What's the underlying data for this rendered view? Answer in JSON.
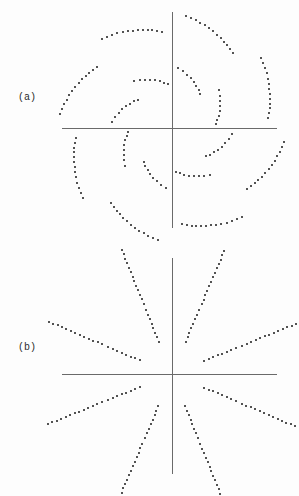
{
  "figure": {
    "width": 299,
    "height": 496,
    "background": "#fdfdfd",
    "dot_color": "#1a1a1a",
    "axis_color": "#6a6a6a",
    "label_color": "#2b2b2b",
    "dot_size_px": 2
  },
  "panels": [
    {
      "id": "a",
      "label": "(a)",
      "label_x": 18,
      "label_y": 98,
      "origin_x": 172,
      "origin_y": 128,
      "axes": {
        "h": {
          "x1": 62,
          "x2": 277,
          "y": 128
        },
        "v": {
          "y1": 12,
          "y2": 228,
          "x": 172
        }
      },
      "pattern_type": "spiral-arcs",
      "description": "Sixteen dotted spiral arcs arranged radially in two concentric rings around the crossed axes.",
      "rings": [
        {
          "radius": 52,
          "arc_span_deg": 34,
          "curl_deg": 30,
          "n_dots": 8,
          "n_arcs": 8,
          "phase_deg": 22
        },
        {
          "radius": 105,
          "arc_span_deg": 32,
          "curl_deg": 30,
          "n_dots": 13,
          "n_arcs": 8,
          "phase_deg": 22
        }
      ]
    },
    {
      "id": "b",
      "label": "(b)",
      "label_x": 18,
      "label_y": 348,
      "origin_x": 172,
      "origin_y": 374,
      "axes": {
        "h": {
          "x1": 62,
          "x2": 277,
          "y": 374
        },
        "v": {
          "y1": 258,
          "y2": 474,
          "x": 172
        }
      },
      "pattern_type": "radial-segments",
      "description": "Sixteen dotted straight line segments pointing radially outward from the crossed axes in two concentric rings.",
      "rings": [
        {
          "radius": 52,
          "arc_span_deg": 0,
          "curl_deg": 0,
          "n_dots": 8,
          "n_arcs": 8,
          "phase_deg": 22,
          "seg_len": 34
        },
        {
          "radius": 105,
          "arc_span_deg": 0,
          "curl_deg": 0,
          "n_dots": 13,
          "n_arcs": 8,
          "phase_deg": 22,
          "seg_len": 58
        }
      ]
    }
  ]
}
